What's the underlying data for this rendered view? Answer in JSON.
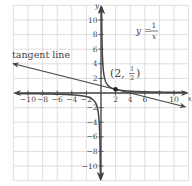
{
  "figure": {
    "function_label": {
      "lhs": "y =",
      "num": "1",
      "den": "x"
    },
    "tangent_label": "tangent line",
    "point_label": {
      "open": "(2,",
      "num": "1",
      "den": "2",
      "close": ")"
    },
    "axis_x_label": "x",
    "axis_y_label": "y",
    "x_ticks": [
      "−10",
      "−8",
      "−6",
      "−4",
      "−2",
      "2",
      "4",
      "6",
      "10"
    ],
    "y_ticks": [
      "10",
      "8",
      "6",
      "4",
      "2",
      "−2",
      "−4",
      "−6",
      "−8",
      "−10"
    ]
  },
  "chart_data": {
    "type": "line",
    "title": "",
    "xlabel": "x",
    "ylabel": "y",
    "xlim": [
      -12,
      12
    ],
    "ylim": [
      -12,
      12
    ],
    "grid": true,
    "series": [
      {
        "name": "y = 1/x",
        "type": "hyperbola",
        "formula": "y = 1/x"
      },
      {
        "name": "tangent line",
        "type": "line",
        "formula": "y = -x/4 + 1",
        "slope": -0.25,
        "intercept": 1,
        "from": [
          -12,
          4
        ],
        "to": [
          11.5,
          -1.875
        ]
      }
    ],
    "points": [
      {
        "label": "(2, 1/2)",
        "x": 2,
        "y": 0.5
      }
    ],
    "annotations": [
      "y = 1/x",
      "tangent line",
      "(2, 1/2)"
    ],
    "x_tick_values": [
      -10,
      -8,
      -6,
      -4,
      -2,
      2,
      4,
      6,
      10
    ],
    "y_tick_values": [
      10,
      8,
      6,
      4,
      2,
      -2,
      -4,
      -6,
      -8,
      -10
    ]
  }
}
